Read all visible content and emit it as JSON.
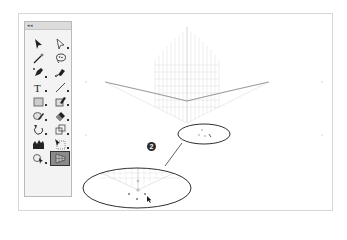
{
  "toolbox": {
    "collapse_label": "◂◂",
    "title": "",
    "tools": [
      {
        "name": "selection-tool",
        "icon": "arrow-black-icon"
      },
      {
        "name": "direct-selection-tool",
        "icon": "arrow-white-icon"
      },
      {
        "name": "magic-wand-tool",
        "icon": "magic-wand-icon"
      },
      {
        "name": "lasso-tool",
        "icon": "lasso-icon"
      },
      {
        "name": "pen-tool",
        "icon": "pen-icon"
      },
      {
        "name": "blob-brush-tool",
        "icon": "brush-icon"
      },
      {
        "name": "type-tool",
        "icon": "type-icon",
        "glyph": "T"
      },
      {
        "name": "line-segment-tool",
        "icon": "line-icon"
      },
      {
        "name": "rectangle-tool",
        "icon": "rectangle-icon"
      },
      {
        "name": "shaper-tool",
        "icon": "shaper-icon"
      },
      {
        "name": "pencil-tool",
        "icon": "pencil-icon"
      },
      {
        "name": "eraser-tool",
        "icon": "eraser-icon"
      },
      {
        "name": "rotate-tool",
        "icon": "rotate-icon"
      },
      {
        "name": "scale-tool",
        "icon": "scale-icon"
      },
      {
        "name": "graph-tool",
        "icon": "graph-icon"
      },
      {
        "name": "free-transform-tool",
        "icon": "free-transform-icon"
      },
      {
        "name": "shape-builder-tool",
        "icon": "shape-builder-icon"
      },
      {
        "name": "perspective-grid-tool",
        "icon": "perspective-grid-icon",
        "active": true
      }
    ]
  },
  "annotation": {
    "step_number": "2"
  },
  "colors": {
    "frame_border": "#d6d6d6",
    "grid_line": "#cfcfcf",
    "callout": "#3a3a3a",
    "active_tool_bg": "#8a8a8a"
  }
}
